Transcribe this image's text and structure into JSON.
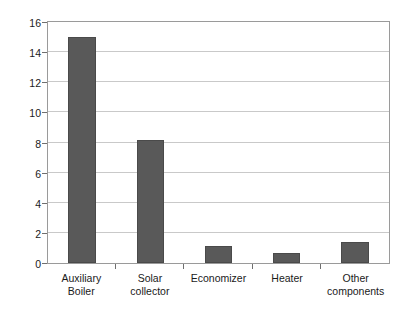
{
  "chart_data": {
    "type": "bar",
    "title": "",
    "subtitle": "",
    "xlabel": "",
    "ylabel": "Exergy destruction rate (kW)",
    "categories": [
      "Auxiliary Boiler",
      "Solar collector",
      "Economizer",
      "Heater",
      "Other components"
    ],
    "category_lines": [
      [
        "Auxiliary",
        "Boiler"
      ],
      [
        "Solar",
        "collector"
      ],
      [
        "Economizer",
        ""
      ],
      [
        "Heater",
        ""
      ],
      [
        "Other",
        "components"
      ]
    ],
    "values": [
      15.0,
      8.2,
      1.1,
      0.65,
      1.4
    ],
    "ylim": [
      0,
      16
    ],
    "ytick_values": [
      0,
      2,
      4,
      6,
      8,
      10,
      12,
      14,
      16
    ],
    "ytick_labels": [
      "0",
      "2",
      "4",
      "6",
      "8",
      "10",
      "12",
      "14",
      "16"
    ],
    "grid": true,
    "grid_axis": "y",
    "legend": false,
    "legend_position": "none",
    "bar_color": "#595959",
    "bar_edge_color": "#4a4a4a",
    "grid_color": "#c9c9c9",
    "frame_color": "#9a9a9a",
    "text_color": "#1a1a1a",
    "background": "#ffffff"
  }
}
